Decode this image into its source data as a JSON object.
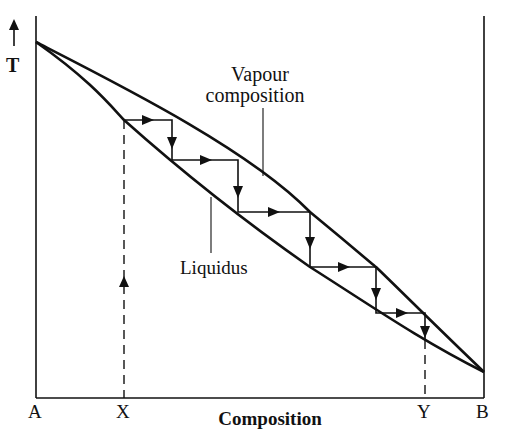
{
  "diagram": {
    "type": "phase-diagram",
    "y_axis": {
      "label": "T",
      "arrow": "up-arrow-icon"
    },
    "x_axis": {
      "label": "Composition",
      "ticks": [
        {
          "label": "A",
          "position": "left-end"
        },
        {
          "label": "X",
          "position": "initial-composition"
        },
        {
          "label": "Y",
          "position": "distillate-composition"
        },
        {
          "label": "B",
          "position": "right-end"
        }
      ]
    },
    "curves": [
      {
        "name": "Vapour composition",
        "label_line1": "Vapour",
        "label_line2": "composition",
        "role": "upper-curve"
      },
      {
        "name": "Liquidus",
        "label_line1": "Liquidus",
        "role": "lower-curve"
      }
    ],
    "steps": 5,
    "colors": {
      "line": "#111111",
      "background": "#ffffff"
    }
  }
}
